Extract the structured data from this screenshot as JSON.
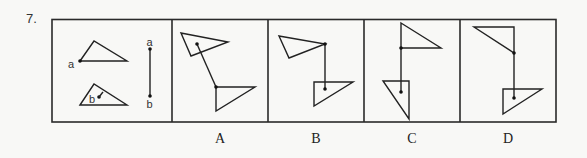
{
  "question": {
    "number": "7."
  },
  "reference_panel": {
    "triangle_a_label": "a",
    "triangle_b_label": "b",
    "segment_top_label": "a",
    "segment_bottom_label": "b"
  },
  "options": [
    {
      "id": "A",
      "label": "A"
    },
    {
      "id": "B",
      "label": "B"
    },
    {
      "id": "C",
      "label": "C"
    },
    {
      "id": "D",
      "label": "D"
    }
  ],
  "colors": {
    "background": "#f8f8f6",
    "ink": "#222222"
  }
}
